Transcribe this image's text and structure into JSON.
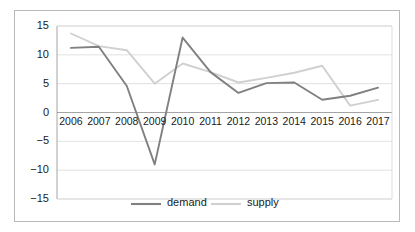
{
  "chart_data": {
    "type": "line",
    "title": "",
    "xlabel": "",
    "ylabel": "",
    "categories": [
      "2006",
      "2007",
      "2008",
      "2009",
      "2010",
      "2011",
      "2012",
      "2013",
      "2014",
      "2015",
      "2016",
      "2017"
    ],
    "series": [
      {
        "name": "demand",
        "color": "#808080",
        "values": [
          11.2,
          11.4,
          4.6,
          -9.0,
          13.0,
          7.0,
          3.4,
          5.1,
          5.2,
          2.2,
          2.9,
          4.3
        ]
      },
      {
        "name": "supply",
        "color": "#d0d0d0",
        "values": [
          13.7,
          11.5,
          10.8,
          5.0,
          8.5,
          7.0,
          5.2,
          6.0,
          6.9,
          8.1,
          1.2,
          2.2
        ]
      }
    ],
    "ylim": [
      -15,
      15
    ],
    "yticks": [
      "15",
      "10",
      "5",
      "0",
      "-5",
      "-10",
      "-15"
    ],
    "ytick_values": [
      15,
      10,
      5,
      0,
      -5,
      -10,
      -15
    ],
    "grid": true,
    "grid_axis": "y",
    "legend_position": "bottom",
    "legend": [
      "demand",
      "supply"
    ],
    "xaxis_label_position": "zero-line"
  },
  "style": {
    "grid_color": "#d9d9d9",
    "axis_color": "#9a9a9a",
    "frame_color": "#b9b9b9",
    "text_color": "#1a1a1a",
    "background": "#ffffff"
  }
}
